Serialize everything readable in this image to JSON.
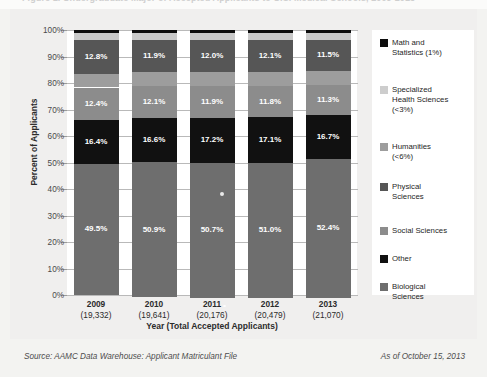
{
  "title_partial": "Figure 1. Undergraduate Major of Accepted Applicants to U.S. Medical Schools, 2009-2013",
  "footer": {
    "source": "Source: AAMC Data Warehouse: Applicant Matriculant File",
    "as_of": "As of October 15, 2013"
  },
  "chart_data": {
    "type": "bar",
    "stacked": true,
    "title": "",
    "xlabel": "Year (Total Accepted Applicants)",
    "ylabel": "Percent of Applicants",
    "ylim": [
      0,
      100
    ],
    "ytick_labels": [
      "0%",
      "10%",
      "20%",
      "30%",
      "40%",
      "50%",
      "60%",
      "70%",
      "80%",
      "90%",
      "100%"
    ],
    "ytick_values": [
      0,
      10,
      20,
      30,
      40,
      50,
      60,
      70,
      80,
      90,
      100
    ],
    "grid": true,
    "legend_position": "right",
    "categories": [
      "2009",
      "2010",
      "2011",
      "2012",
      "2013"
    ],
    "category_totals": [
      "(19,332)",
      "(19,641)",
      "(20,176)",
      "(20,479)",
      "(21,070)"
    ],
    "stack_order_top_to_bottom": [
      "Math and Statistics (1%)",
      "Specialized Health Sciences (<3%)",
      "Physical Sciences",
      "Humanities (<6%)",
      "Social Sciences",
      "Other",
      "Biological Sciences"
    ],
    "series": [
      {
        "name": "Math and Statistics (1%)",
        "color": "#0d0d0d",
        "values": [
          1.0,
          1.0,
          1.0,
          1.0,
          1.0
        ],
        "labels": [
          "",
          "",
          "",
          "",
          ""
        ]
      },
      {
        "name": "Specialized Health Sciences (<3%)",
        "color": "#c9c9c9",
        "values": [
          2.8,
          2.8,
          2.8,
          2.8,
          2.8
        ],
        "labels": [
          "",
          "",
          "",
          "",
          ""
        ]
      },
      {
        "name": "Physical Sciences",
        "color": "#565656",
        "values": [
          12.8,
          11.9,
          12.0,
          12.1,
          11.5
        ],
        "labels": [
          "12.8%",
          "11.9%",
          "12.0%",
          "12.1%",
          "11.5%"
        ]
      },
      {
        "name": "Humanities (<6%)",
        "color": "#9d9d9d",
        "values": [
          5.1,
          5.5,
          5.4,
          5.3,
          5.4
        ],
        "labels": [
          "",
          "",
          "",
          "",
          ""
        ]
      },
      {
        "name": "Social Sciences",
        "color": "#8c8c8c",
        "values": [
          12.4,
          12.1,
          11.9,
          11.8,
          11.3
        ],
        "labels": [
          "12.4%",
          "12.1%",
          "11.9%",
          "11.8%",
          "11.3%"
        ]
      },
      {
        "name": "Other",
        "color": "#111111",
        "values": [
          16.4,
          16.6,
          17.2,
          17.1,
          16.7
        ],
        "labels": [
          "16.4%",
          "16.6%",
          "17.2%",
          "17.1%",
          "16.7%"
        ]
      },
      {
        "name": "Biological Sciences",
        "color": "#6e6e6e",
        "values": [
          49.5,
          50.9,
          50.7,
          51.0,
          52.4
        ],
        "labels": [
          "49.5%",
          "50.9%",
          "50.7%",
          "51.0%",
          "52.4%"
        ]
      }
    ],
    "legend_entries": [
      {
        "label": "Math and\nStatistics (1%)",
        "color": "#0d0d0d"
      },
      {
        "label": "Specialized\nHealth Sciences\n(<3%)",
        "color": "#cdcdcd"
      },
      {
        "label": "Humanities\n(<6%)",
        "color": "#9d9d9d"
      },
      {
        "label": "Physical\nSciences",
        "color": "#565656"
      },
      {
        "label": "Social Sciences",
        "color": "#8c8c8c"
      },
      {
        "label": "Other",
        "color": "#111111"
      },
      {
        "label": "Biological\nSciences",
        "color": "#6e6e6e"
      }
    ]
  }
}
